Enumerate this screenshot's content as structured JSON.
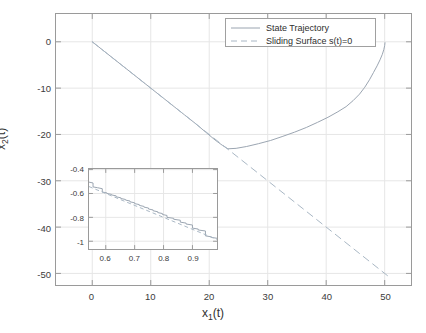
{
  "chart_data": {
    "type": "line",
    "title": "",
    "xlabel": "x_1(t)",
    "ylabel": "x_2(t)",
    "xlabel_base": "x",
    "xlabel_sub": "1",
    "xlabel_tail": "(t)",
    "ylabel_base": "x",
    "ylabel_sub": "2",
    "ylabel_tail": "(t)",
    "xlim": [
      -6.2,
      54.5
    ],
    "ylim": [
      -52.5,
      6.0
    ],
    "xticks": [
      0,
      10,
      20,
      30,
      40,
      50
    ],
    "xticklabels": [
      "0",
      "10",
      "20",
      "30",
      "40",
      "50"
    ],
    "yticks": [
      0,
      -10,
      -20,
      -30,
      -40,
      -50
    ],
    "yticklabels": [
      "0",
      "-10",
      "-20",
      "-30",
      "-40",
      "-50"
    ],
    "grid": true,
    "legend_position": "top-right-inside",
    "series": [
      {
        "name": "State Trajectory",
        "style": "solid",
        "color": "#9aa4b0",
        "x": [
          0,
          1.6,
          3.3,
          5.0,
          6.8,
          8.6,
          10.4,
          12.2,
          14.0,
          15.8,
          17.6,
          19.3,
          21.0,
          22.3,
          23.2,
          24.6,
          26.4,
          28.4,
          30.5,
          32.6,
          34.6,
          36.6,
          38.5,
          40.3,
          42.0,
          43.4,
          44.6,
          45.7,
          46.6,
          47.4,
          48.1,
          48.7,
          49.2,
          49.6,
          49.85,
          50.0,
          50.05
        ],
        "y": [
          0,
          -1.6,
          -3.3,
          -5.0,
          -6.8,
          -8.6,
          -10.4,
          -12.2,
          -14.0,
          -15.8,
          -17.6,
          -19.4,
          -21.2,
          -22.4,
          -23.1,
          -23.0,
          -22.6,
          -22.0,
          -21.3,
          -20.4,
          -19.5,
          -18.5,
          -17.4,
          -16.3,
          -15.1,
          -14.0,
          -12.7,
          -11.3,
          -9.8,
          -8.2,
          -6.6,
          -5.2,
          -3.9,
          -2.7,
          -1.7,
          -0.8,
          -0.2
        ]
      },
      {
        "name": "Sliding Surface s(t)=0",
        "style": "dashed",
        "color": "#a8b6c4",
        "x": [
          0,
          50.5
        ],
        "y": [
          0,
          -50.5
        ]
      }
    ],
    "legend": [
      {
        "label": "State Trajectory",
        "style": "solid",
        "color": "#9aa4b0"
      },
      {
        "label": "Sliding Surface s(t)=0",
        "style": "dashed",
        "color": "#a8b6c4"
      }
    ],
    "inset": {
      "xlim": [
        0.542,
        0.985
      ],
      "ylim": [
        -1.065,
        -0.395
      ],
      "xticks": [
        0.6,
        0.7,
        0.8,
        0.9
      ],
      "xticklabels": [
        "0.6",
        "0.7",
        "0.8",
        "0.9"
      ],
      "yticks": [
        -0.4,
        -0.6,
        -0.8,
        -1.0
      ],
      "yticklabels": [
        "-0.4",
        "-0.6",
        "-0.8",
        "-1"
      ],
      "grid": true,
      "series": [
        {
          "name": "State Trajectory",
          "style": "staircase",
          "color": "#9aa4b0",
          "x": [
            0.542,
            0.556,
            0.556,
            0.572,
            0.572,
            0.588,
            0.588,
            0.604,
            0.604,
            0.62,
            0.62,
            0.636,
            0.636,
            0.652,
            0.652,
            0.668,
            0.668,
            0.684,
            0.684,
            0.7,
            0.7,
            0.716,
            0.716,
            0.732,
            0.732,
            0.748,
            0.748,
            0.764,
            0.764,
            0.78,
            0.78,
            0.796,
            0.796,
            0.812,
            0.812,
            0.835,
            0.835,
            0.858,
            0.858,
            0.878,
            0.878,
            0.9,
            0.9,
            0.92,
            0.92,
            0.945,
            0.945,
            0.965,
            0.965,
            0.985
          ],
          "y": [
            -0.505,
            -0.512,
            -0.545,
            -0.552,
            -0.552,
            -0.56,
            -0.588,
            -0.595,
            -0.6,
            -0.608,
            -0.612,
            -0.62,
            -0.628,
            -0.636,
            -0.642,
            -0.65,
            -0.655,
            -0.663,
            -0.67,
            -0.678,
            -0.685,
            -0.693,
            -0.7,
            -0.708,
            -0.714,
            -0.722,
            -0.73,
            -0.738,
            -0.745,
            -0.753,
            -0.76,
            -0.768,
            -0.776,
            -0.784,
            -0.8,
            -0.808,
            -0.816,
            -0.824,
            -0.84,
            -0.848,
            -0.856,
            -0.864,
            -0.89,
            -0.898,
            -0.906,
            -0.914,
            -0.955,
            -0.963,
            -0.968,
            -0.975
          ]
        },
        {
          "name": "Sliding Surface s(t)=0",
          "style": "dashed",
          "color": "#a8b6c4",
          "x": [
            0.542,
            0.985
          ],
          "y": [
            -0.542,
            -0.985
          ]
        }
      ]
    },
    "colors": {
      "trajectory": "#9aa4b0",
      "sliding_surface": "#a8b6c4",
      "grid": "#e6e6e6",
      "axis": "#9a9a9a",
      "text": "#3b3b3b",
      "background": "#ffffff"
    }
  }
}
